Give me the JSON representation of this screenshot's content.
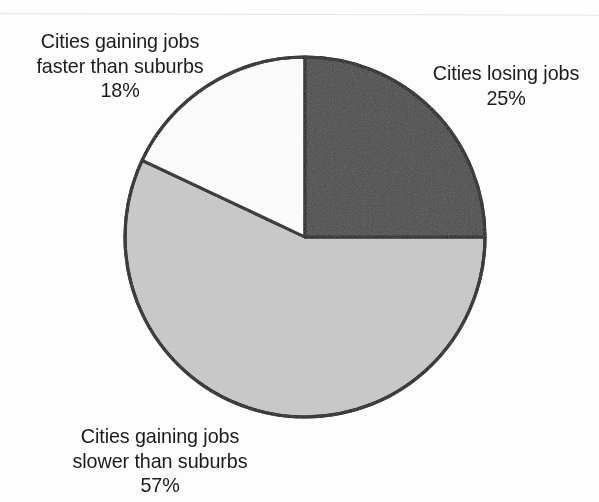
{
  "figure": {
    "background_color": "#fdfdfd",
    "text_color": "#1b1b1b",
    "outline_color": "#1a1a1a"
  },
  "chart_data": {
    "type": "pie",
    "title": "",
    "subtitle": "",
    "xlabel": "",
    "ylabel": "",
    "legend_position": "none",
    "grid": false,
    "units": "percent",
    "start_angle_deg": 0,
    "direction": "clockwise",
    "center": {
      "x": 305,
      "y": 237
    },
    "radius": 180,
    "categories": [
      "Cities losing jobs",
      "Cities gaining jobs slower than suburbs",
      "Cities gaining jobs faster than suburbs"
    ],
    "values": [
      25,
      57,
      18
    ],
    "value_labels": [
      "25%",
      "57%",
      "18%"
    ],
    "slice_colors": [
      "#4a4a4a",
      "#c9c9c9",
      "#ffffff"
    ],
    "slices": [
      {
        "name": "cities-losing-jobs",
        "label": "Cities losing jobs",
        "value": 25,
        "value_label": "25%",
        "color": "#4a4a4a",
        "start_deg": 0,
        "end_deg": 90
      },
      {
        "name": "cities-gaining-jobs-slower",
        "label": "Cities gaining jobs slower than suburbs",
        "value": 57,
        "value_label": "57%",
        "color": "#c9c9c9",
        "start_deg": 90,
        "end_deg": 295.2
      },
      {
        "name": "cities-gaining-jobs-faster",
        "label": "Cities gaining jobs faster than suburbs",
        "value": 18,
        "value_label": "18%",
        "color": "#ffffff",
        "start_deg": 295.2,
        "end_deg": 360
      }
    ]
  },
  "labels": {
    "gaining_faster": {
      "line1": "Cities gaining jobs",
      "line2": "faster than suburbs",
      "line3": "18%"
    },
    "losing": {
      "line1": "Cities losing jobs",
      "line2": "25%"
    },
    "gaining_slower": {
      "line1": "Cities gaining jobs",
      "line2": "slower than suburbs",
      "line3": "57%"
    }
  }
}
